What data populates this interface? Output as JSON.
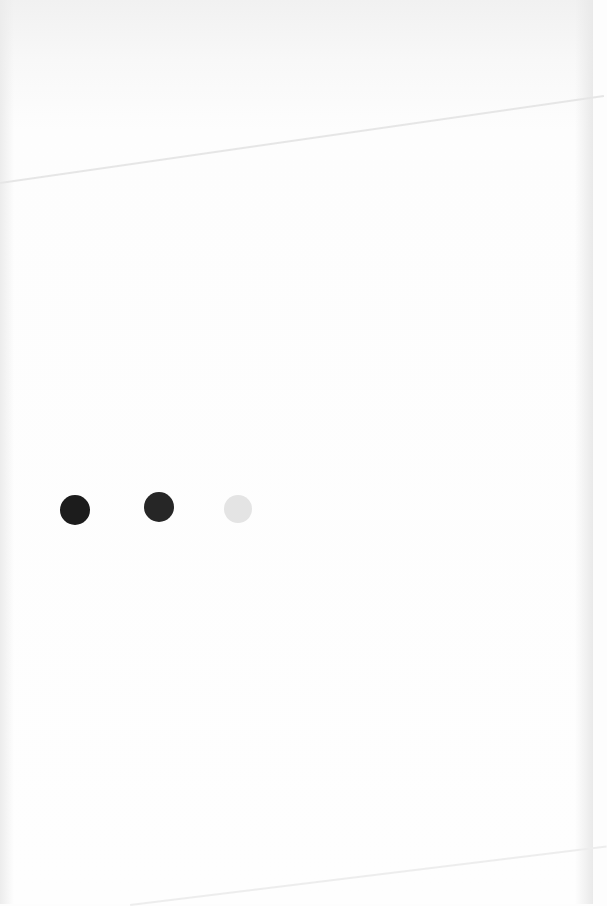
{
  "scene": {
    "description": "Photo of a sheet of white paper with three painted dots in a row",
    "background_color": "#fdfdfd"
  },
  "dots": [
    {
      "color": "#1c1c1c",
      "cx": 75,
      "cy": 510,
      "r": 15
    },
    {
      "color": "#262626",
      "cx": 159,
      "cy": 507,
      "r": 15
    },
    {
      "color": "#e4e4e4",
      "cx": 238,
      "cy": 509,
      "r": 14
    }
  ]
}
